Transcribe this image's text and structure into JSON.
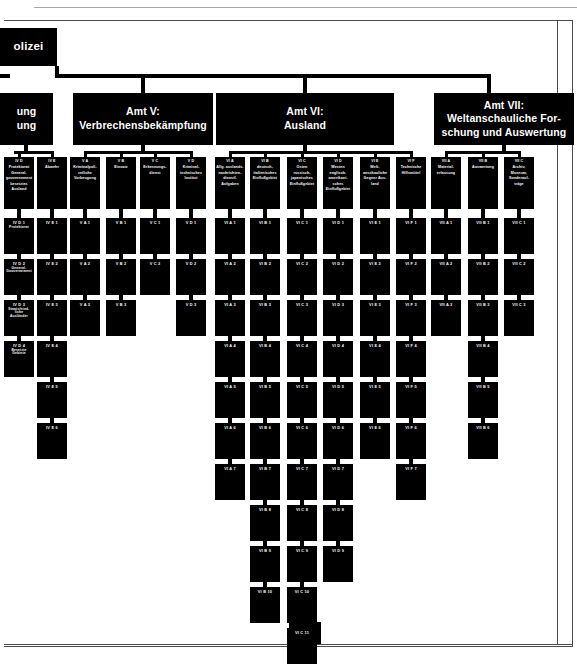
{
  "document": {
    "type": "organizational-chart",
    "title_fragment": "olizei",
    "left_amt_fragment_line1": "ung",
    "left_amt_fragment_line2": "ung"
  },
  "amter": [
    {
      "id": "amt5",
      "line1": "Amt V:",
      "line2": "Verbrechensbekämpfung"
    },
    {
      "id": "amt6",
      "line1": "Amt VI:",
      "line2": "Ausland"
    },
    {
      "id": "amt7",
      "line1": "Amt VII:",
      "line2": "Weltanschauliche For-",
      "line3": "schung und Auswertung"
    }
  ],
  "groups": [
    {
      "code": "IV D",
      "desc": [
        "Protektorat",
        "General-",
        "gouvernement",
        "besetztes",
        "Ausland"
      ],
      "subs": [
        "IV D 1",
        "IV D 2",
        "IV D 3",
        "IV D 4"
      ],
      "sub_desc": [
        [
          "Protektorat"
        ],
        [
          "General-",
          "Gouvernement"
        ],
        [
          "Staatsfeind-",
          "liche",
          "Ausländer"
        ],
        [
          "Besetzte",
          "Gebiete"
        ]
      ]
    },
    {
      "code": "IV E",
      "desc": [
        "Abwehr"
      ],
      "subs": [
        "IV E 1",
        "IV E 2",
        "IV E 3",
        "IV E 4",
        "IV E 5",
        "IV E 6"
      ],
      "sub_desc": []
    },
    {
      "code": "V A",
      "desc": [
        "Kriminalpoli-",
        "zeiliche",
        "Vorbeugung"
      ],
      "subs": [
        "V A 1",
        "V A 2",
        "V A 3"
      ],
      "sub_desc": []
    },
    {
      "code": "V B",
      "desc": [
        "Einsatz"
      ],
      "subs": [
        "V B 1",
        "V B 2",
        "V B 3"
      ],
      "sub_desc": []
    },
    {
      "code": "V C",
      "desc": [
        "Erkennungs-",
        "dienst"
      ],
      "subs": [
        "V C 1",
        "V C 2"
      ],
      "sub_desc": []
    },
    {
      "code": "V D",
      "desc": [
        "Kriminal-",
        "technisches",
        "Institut"
      ],
      "subs": [
        "V D 1",
        "V D 2",
        "V D 3"
      ],
      "sub_desc": []
    },
    {
      "code": "VI A",
      "desc": [
        "Allg. auslands-",
        "nachrichten-",
        "dienstl.",
        "Aufgaben"
      ],
      "subs": [
        "VI A 1",
        "VI A 2",
        "VI A 3",
        "VI A 4",
        "VI A 5",
        "VI A 6",
        "VI A 7"
      ],
      "sub_desc": []
    },
    {
      "code": "VI B",
      "desc": [
        "deutsch-",
        "italienisches",
        "Einflußgebiet"
      ],
      "subs": [
        "VI B 1",
        "VI B 2",
        "VI B 3",
        "VI B 4",
        "VI B 5",
        "VI B 6",
        "VI B 7",
        "VI B 8",
        "VI B 9",
        "VI B 10"
      ],
      "sub_desc": []
    },
    {
      "code": "VI C",
      "desc": [
        "Osten",
        "russisch-",
        "japanisches",
        "Einflußgebiet"
      ],
      "subs": [
        "VI C 1",
        "VI C 2",
        "VI C 3",
        "VI C 4",
        "VI C 5",
        "VI C 6",
        "VI C 7",
        "VI C 8",
        "VI C 9",
        "VI C 10",
        "VI C 11"
      ],
      "sub_desc": []
    },
    {
      "code": "VI D",
      "desc": [
        "Westen",
        "englisch-",
        "amerikani-",
        "sches",
        "Einflußgebiet"
      ],
      "subs": [
        "VI D 1",
        "VI D 2",
        "VI D 3",
        "VI D 4",
        "VI D 5",
        "VI D 6",
        "VI D 7",
        "VI D 8",
        "VI D 9"
      ],
      "sub_desc": []
    },
    {
      "code": "VI E",
      "desc": [
        "Welt-",
        "anschauliche",
        "Gegner Aus-",
        "land"
      ],
      "subs": [
        "VI E 1",
        "VI E 2",
        "VI E 3",
        "VI E 4",
        "VI E 5",
        "VI E 6"
      ],
      "sub_desc": []
    },
    {
      "code": "VI F",
      "desc": [
        "Technische",
        "Hilfsmittel"
      ],
      "subs": [
        "VI F 1",
        "VI F 2",
        "VI F 3",
        "VI F 4",
        "VI F 5",
        "VI F 6",
        "VI F 7"
      ],
      "sub_desc": []
    },
    {
      "code": "VII A",
      "desc": [
        "Material-",
        "erfassung"
      ],
      "subs": [
        "VII A 1",
        "VII A 2",
        "VII A 3"
      ],
      "sub_desc": []
    },
    {
      "code": "VII B",
      "desc": [
        "Auswertung"
      ],
      "subs": [
        "VII B 1",
        "VII B 2",
        "VII B 3",
        "VII B 4",
        "VII B 5",
        "VII B 6"
      ],
      "sub_desc": []
    },
    {
      "code": "VII C",
      "desc": [
        "Archiv,",
        "Museum,",
        "Sonderauf-",
        "träge"
      ],
      "subs": [
        "VII C 1",
        "VII C 2",
        "VII C 3"
      ],
      "sub_desc": []
    }
  ],
  "layout": {
    "group_x": [
      4,
      37,
      70,
      106,
      140,
      176,
      215,
      250,
      287,
      323,
      360,
      396,
      431,
      468,
      504
    ],
    "group_w": 30,
    "group_y": 157,
    "group_h": 52,
    "sub_y0": 218,
    "sub_h": 36,
    "sub_gap": 5,
    "amt5": {
      "x": 73,
      "y": 93,
      "w": 140,
      "h": 52
    },
    "amt6": {
      "x": 216,
      "y": 93,
      "w": 178,
      "h": 52
    },
    "amt7": {
      "x": 434,
      "y": 93,
      "w": 140,
      "h": 52
    },
    "title_box": {
      "x": 0,
      "y": 28,
      "w": 57,
      "h": 38
    },
    "left_amt": {
      "x": 0,
      "y": 93,
      "w": 53,
      "h": 52
    },
    "stray_box": {
      "x": 289,
      "y": 622,
      "w": 32,
      "h": 22
    }
  }
}
